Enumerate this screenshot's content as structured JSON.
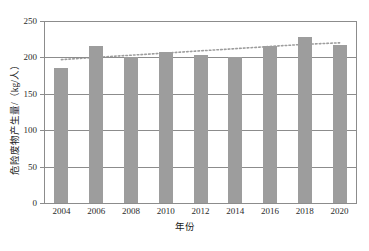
{
  "chart_data": {
    "type": "bar",
    "title": "",
    "subtitle": "",
    "xlabel": "年份",
    "ylabel": "危险废物产生量/（kg/人）",
    "categories": [
      "2004",
      "2006",
      "2008",
      "2010",
      "2012",
      "2014",
      "2016",
      "2018",
      "2020"
    ],
    "values": [
      186,
      215,
      200,
      207,
      204,
      200,
      215,
      228,
      217
    ],
    "series": [
      {
        "name": "危险废物产生量",
        "values": [
          186,
          215,
          200,
          207,
          204,
          200,
          215,
          228,
          217
        ]
      },
      {
        "name": "趋势线",
        "type": "trendline",
        "style": "dotted",
        "values": [
          197,
          200,
          203,
          206,
          209,
          212,
          215,
          218,
          220
        ]
      }
    ],
    "ylim": [
      0,
      250
    ],
    "yticks": [
      0,
      50,
      100,
      150,
      200,
      250
    ],
    "ytick_labels": [
      "0",
      "50",
      "100",
      "150",
      "200",
      "250"
    ],
    "grid": true,
    "grid_axis": "y",
    "legend": "none",
    "bar_color": "#9d9d9d",
    "axis_color": "#8c8c8c",
    "trendline_color": "#9d9d9d",
    "background": "#ffffff"
  }
}
